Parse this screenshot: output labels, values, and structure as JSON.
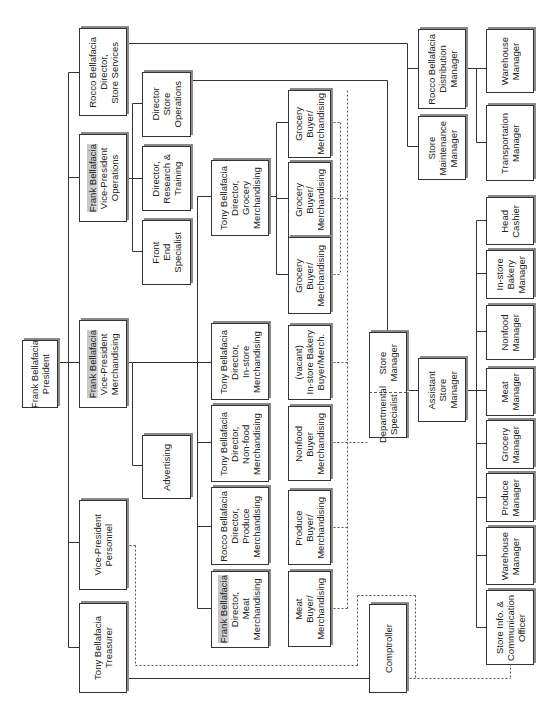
{
  "chart_title": "",
  "orientation": "rotated-90-ccw",
  "colors": {
    "line": "#333333",
    "box_border": "#333333",
    "shadow": "#8a8a8a",
    "highlight": "#cccccc"
  },
  "boxes": [
    {
      "id": "president",
      "lines": [
        "Frank Bellafacia",
        "President"
      ],
      "x": 22,
      "y": 340,
      "w": 34,
      "h": 66,
      "hl": false
    },
    {
      "id": "treasurer",
      "lines": [
        "Tony Bellafacia",
        "Treasurer"
      ],
      "x": 79,
      "y": 603,
      "w": 46,
      "h": 88,
      "hl": false
    },
    {
      "id": "vp-personnel",
      "lines": [
        "Vice-President",
        "Personnel"
      ],
      "x": 79,
      "y": 500,
      "w": 46,
      "h": 88,
      "hl": false
    },
    {
      "id": "vp-merchandising",
      "lines": [
        "Frank Bellafacia",
        "Vice-President",
        "Merchandising"
      ],
      "x": 79,
      "y": 320,
      "w": 46,
      "h": 86,
      "hl": true
    },
    {
      "id": "vp-operations",
      "lines": [
        "Frank Bellafacia",
        "Vice-President",
        "Operations"
      ],
      "x": 79,
      "y": 134,
      "w": 46,
      "h": 86,
      "hl": true
    },
    {
      "id": "dir-store-services",
      "lines": [
        "Rocco Bellafacia",
        "Director,",
        "Store Services"
      ],
      "x": 79,
      "y": 28,
      "w": 46,
      "h": 86,
      "hl": false
    },
    {
      "id": "advertising",
      "lines": [
        "Advertising"
      ],
      "x": 142,
      "y": 435,
      "w": 47,
      "h": 62,
      "hl": false
    },
    {
      "id": "dir-store-operations",
      "lines": [
        "Director",
        "Store",
        "Operations"
      ],
      "x": 142,
      "y": 72,
      "w": 47,
      "h": 63,
      "hl": false
    },
    {
      "id": "dir-research-training",
      "lines": [
        "Director,",
        "Research &",
        "Training"
      ],
      "x": 142,
      "y": 146,
      "w": 47,
      "h": 63,
      "hl": false
    },
    {
      "id": "front-end-specialist",
      "lines": [
        "Front",
        "End",
        "Specialist"
      ],
      "x": 142,
      "y": 220,
      "w": 47,
      "h": 63,
      "hl": false
    },
    {
      "id": "dir-grocery",
      "lines": [
        "Tony Bellafacia",
        "Director,",
        "Grocery",
        "Merchandising"
      ],
      "x": 211,
      "y": 160,
      "w": 56,
      "h": 74,
      "hl": false
    },
    {
      "id": "dir-instore",
      "lines": [
        "Tony Bellafacia",
        "Director,",
        "In-store",
        "Merchandising"
      ],
      "x": 211,
      "y": 323,
      "w": 56,
      "h": 75,
      "hl": false
    },
    {
      "id": "dir-nonfood",
      "lines": [
        "Tony Bellafacia",
        "Director,",
        "Non-food",
        "Merchandising"
      ],
      "x": 211,
      "y": 405,
      "w": 56,
      "h": 75,
      "hl": false
    },
    {
      "id": "dir-produce",
      "lines": [
        "Rocco Bellafacia",
        "Director,",
        "Produce",
        "Merchandising"
      ],
      "x": 211,
      "y": 487,
      "w": 56,
      "h": 76,
      "hl": false
    },
    {
      "id": "dir-meat",
      "lines": [
        "Frank Bellafacia",
        "Director,",
        "Meat",
        "Merchandising"
      ],
      "x": 211,
      "y": 571,
      "w": 56,
      "h": 75,
      "hl": true
    },
    {
      "id": "grocery-buyer-1",
      "lines": [
        "Grocery",
        "Buyer/",
        "Merchandising"
      ],
      "x": 288,
      "y": 90,
      "w": 41,
      "h": 66,
      "hl": false
    },
    {
      "id": "grocery-buyer-2",
      "lines": [
        "Grocery",
        "Buyer/",
        "Merchandising"
      ],
      "x": 288,
      "y": 162,
      "w": 41,
      "h": 74,
      "hl": false
    },
    {
      "id": "grocery-buyer-3",
      "lines": [
        "Grocery",
        "Buyer/",
        "Merchandising"
      ],
      "x": 288,
      "y": 237,
      "w": 41,
      "h": 75,
      "hl": false
    },
    {
      "id": "instore-bakery-buyer",
      "lines": [
        "(vacant)",
        "In-store Bakery",
        "Buyer/Merch."
      ],
      "x": 288,
      "y": 325,
      "w": 41,
      "h": 73,
      "hl": false
    },
    {
      "id": "nonfood-buyer",
      "lines": [
        "Nonfood",
        "Buyer",
        "Merchandising"
      ],
      "x": 288,
      "y": 406,
      "w": 41,
      "h": 73,
      "hl": false
    },
    {
      "id": "produce-buyer",
      "lines": [
        "Produce",
        "Buyer/",
        "Merchandising"
      ],
      "x": 288,
      "y": 490,
      "w": 41,
      "h": 73,
      "hl": false
    },
    {
      "id": "meat-buyer",
      "lines": [
        "Meat",
        "Buyer/",
        "Merchandising"
      ],
      "x": 288,
      "y": 571,
      "w": 41,
      "h": 74,
      "hl": false
    },
    {
      "id": "store-manager",
      "lines": [
        "Store",
        "Manager"
      ],
      "x": 369,
      "y": 332,
      "w": 36,
      "h": 60,
      "hl": false
    },
    {
      "id": "departmental-specialist",
      "lines": [
        "Departmental",
        "Specialist"
      ],
      "x": 369,
      "y": 392,
      "w": 36,
      "h": 44,
      "hl": false
    },
    {
      "id": "assistant-store-manager",
      "lines": [
        "Assistant",
        "Store",
        "Manager"
      ],
      "x": 418,
      "y": 358,
      "w": 46,
      "h": 62,
      "hl": false
    },
    {
      "id": "comptroller",
      "lines": [
        "Comptroller"
      ],
      "x": 369,
      "y": 604,
      "w": 36,
      "h": 87,
      "hl": false
    },
    {
      "id": "store-maintenance-manager",
      "lines": [
        "Store",
        "Maintenance",
        "Manager"
      ],
      "x": 418,
      "y": 116,
      "w": 46,
      "h": 62,
      "hl": false
    },
    {
      "id": "distribution-manager",
      "lines": [
        "Rocco Bellafacia",
        "Distribution",
        "Manager"
      ],
      "x": 418,
      "y": 29,
      "w": 46,
      "h": 78,
      "hl": false
    },
    {
      "id": "warehouse-manager-dist",
      "lines": [
        "Warehouse",
        "Manager"
      ],
      "x": 486,
      "y": 29,
      "w": 46,
      "h": 62,
      "hl": false
    },
    {
      "id": "transportation-manager",
      "lines": [
        "Transportation",
        "Manager"
      ],
      "x": 486,
      "y": 105,
      "w": 46,
      "h": 74,
      "hl": false
    },
    {
      "id": "head-cashier",
      "lines": [
        "Head",
        "Cashier"
      ],
      "x": 486,
      "y": 197,
      "w": 46,
      "h": 46,
      "hl": false
    },
    {
      "id": "instore-bakery-manager",
      "lines": [
        "In-store",
        "Bakery",
        "Manager"
      ],
      "x": 486,
      "y": 250,
      "w": 46,
      "h": 47,
      "hl": false
    },
    {
      "id": "nonfood-manager",
      "lines": [
        "Nonfood",
        "Manager"
      ],
      "x": 486,
      "y": 305,
      "w": 46,
      "h": 53,
      "hl": false
    },
    {
      "id": "meat-manager",
      "lines": [
        "Meat",
        "Manager"
      ],
      "x": 486,
      "y": 368,
      "w": 46,
      "h": 46,
      "hl": false
    },
    {
      "id": "grocery-manager",
      "lines": [
        "Grocery",
        "Manager"
      ],
      "x": 486,
      "y": 420,
      "w": 46,
      "h": 47,
      "hl": false
    },
    {
      "id": "produce-manager",
      "lines": [
        "Produce",
        "Manager"
      ],
      "x": 486,
      "y": 473,
      "w": 46,
      "h": 47,
      "hl": false
    },
    {
      "id": "warehouse-manager-store",
      "lines": [
        "Warehouse",
        "Manager"
      ],
      "x": 486,
      "y": 527,
      "w": 46,
      "h": 56,
      "hl": false
    },
    {
      "id": "store-info-officer",
      "lines": [
        "Store Info. &",
        "Communication",
        "Officer"
      ],
      "x": 486,
      "y": 590,
      "w": 46,
      "h": 73,
      "hl": false
    }
  ],
  "solid_lines": [
    [
      55,
      362,
      79,
      362
    ],
    [
      68,
      72,
      68,
      647
    ],
    [
      68,
      72,
      79,
      72
    ],
    [
      68,
      177,
      79,
      177
    ],
    [
      68,
      542,
      79,
      542
    ],
    [
      68,
      647,
      79,
      647
    ],
    [
      125,
      178,
      132,
      178
    ],
    [
      132,
      103,
      132,
      251
    ],
    [
      132,
      103,
      142,
      103
    ],
    [
      132,
      178,
      142,
      178
    ],
    [
      132,
      251,
      142,
      251
    ],
    [
      125,
      362,
      132,
      362
    ],
    [
      132,
      362,
      132,
      465
    ],
    [
      132,
      465,
      142,
      465
    ],
    [
      132,
      362,
      197,
      362
    ],
    [
      197,
      196,
      197,
      608
    ],
    [
      197,
      196,
      211,
      196
    ],
    [
      197,
      362,
      211,
      362
    ],
    [
      197,
      442,
      211,
      442
    ],
    [
      197,
      526,
      211,
      526
    ],
    [
      197,
      608,
      211,
      608
    ],
    [
      267,
      196,
      276,
      196
    ],
    [
      276,
      122,
      276,
      274
    ],
    [
      276,
      122,
      288,
      122
    ],
    [
      276,
      198,
      288,
      198
    ],
    [
      276,
      274,
      288,
      274
    ],
    [
      125,
      43,
      407,
      43
    ],
    [
      407,
      43,
      407,
      146
    ],
    [
      407,
      68,
      418,
      68
    ],
    [
      407,
      146,
      418,
      146
    ],
    [
      189,
      80,
      387,
      80
    ],
    [
      387,
      80,
      387,
      332
    ],
    [
      464,
      68,
      476,
      68
    ],
    [
      476,
      68,
      476,
      142
    ],
    [
      476,
      68,
      486,
      68
    ],
    [
      476,
      142,
      486,
      142
    ],
    [
      405,
      390,
      418,
      390
    ],
    [
      464,
      390,
      476,
      390
    ],
    [
      476,
      220,
      476,
      627
    ],
    [
      476,
      220,
      486,
      220
    ],
    [
      476,
      273,
      486,
      273
    ],
    [
      476,
      331,
      486,
      331
    ],
    [
      476,
      390,
      486,
      390
    ],
    [
      476,
      443,
      486,
      443
    ],
    [
      476,
      497,
      486,
      497
    ],
    [
      476,
      555,
      486,
      555
    ],
    [
      476,
      627,
      486,
      627
    ],
    [
      125,
      678,
      369,
      678
    ]
  ],
  "dashed_lines": [
    [
      329,
      122,
      340,
      122
    ],
    [
      340,
      122,
      340,
      274
    ],
    [
      329,
      198,
      347,
      198
    ],
    [
      329,
      274,
      340,
      274
    ],
    [
      329,
      362,
      347,
      362
    ],
    [
      329,
      442,
      369,
      442
    ],
    [
      329,
      527,
      347,
      527
    ],
    [
      329,
      608,
      347,
      608
    ],
    [
      347,
      90,
      347,
      608
    ],
    [
      125,
      545,
      135,
      545
    ],
    [
      135,
      545,
      135,
      665
    ],
    [
      135,
      665,
      357,
      665
    ],
    [
      357,
      595,
      357,
      665
    ],
    [
      357,
      595,
      415,
      595
    ],
    [
      415,
      595,
      415,
      678
    ],
    [
      405,
      678,
      510,
      678
    ],
    [
      510,
      663,
      510,
      678
    ],
    [
      369,
      392,
      405,
      392
    ]
  ]
}
